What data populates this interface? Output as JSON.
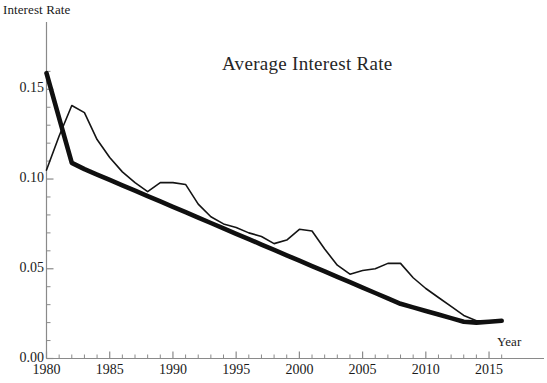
{
  "chart_data": {
    "type": "line",
    "title": "Average Interest Rate",
    "xlabel": "Year",
    "ylabel": "Interest Rate",
    "xlim": [
      1980,
      2016.5
    ],
    "ylim": [
      0.0,
      0.168
    ],
    "grid": false,
    "legend": "none",
    "xticks": [
      1980,
      1985,
      1990,
      1995,
      2000,
      2005,
      2010,
      2015
    ],
    "xtick_labels": [
      "1980",
      "1985",
      "1990",
      "1995",
      "2000",
      "2005",
      "2010",
      "2015"
    ],
    "xminor_step": 1,
    "yticks": [
      0.0,
      0.05,
      0.1,
      0.15
    ],
    "ytick_labels": [
      "0.00",
      "0.05",
      "0.10",
      "0.15"
    ],
    "yminor_step": 0.01,
    "x": [
      1980,
      1981,
      1982,
      1983,
      1984,
      1985,
      1986,
      1987,
      1988,
      1989,
      1990,
      1991,
      1992,
      1993,
      1994,
      1995,
      1996,
      1997,
      1998,
      1999,
      2000,
      2001,
      2002,
      2003,
      2004,
      2005,
      2006,
      2007,
      2008,
      2009,
      2010,
      2011,
      2012,
      2013,
      2014,
      2015,
      2016
    ],
    "series": [
      {
        "name": "Interest Rate",
        "style": "thin",
        "color": "#141414",
        "width": 1.6,
        "values": [
          0.105,
          0.124,
          0.141,
          0.137,
          0.122,
          0.112,
          0.104,
          0.098,
          0.093,
          0.098,
          0.098,
          0.097,
          0.086,
          0.079,
          0.075,
          0.073,
          0.07,
          0.068,
          0.064,
          0.066,
          0.072,
          0.071,
          0.061,
          0.052,
          0.047,
          0.049,
          0.05,
          0.053,
          0.053,
          0.045,
          0.039,
          0.034,
          0.029,
          0.024,
          0.021,
          0.021,
          0.021
        ]
      },
      {
        "name": "Trend",
        "style": "thick",
        "color": "#101010",
        "width": 4.6,
        "values": [
          0.159,
          0.134,
          0.109,
          0.1055,
          0.1025,
          0.0995,
          0.0965,
          0.0935,
          0.0905,
          0.0875,
          0.0845,
          0.0815,
          0.0785,
          0.0755,
          0.0725,
          0.0695,
          0.0665,
          0.0635,
          0.0605,
          0.0575,
          0.0545,
          0.0515,
          0.0485,
          0.0455,
          0.0425,
          0.0395,
          0.0365,
          0.0335,
          0.0305,
          0.0285,
          0.0265,
          0.0245,
          0.0225,
          0.0205,
          0.02,
          0.0205,
          0.021
        ]
      }
    ]
  },
  "axes": {
    "ylabel": "Interest Rate",
    "xlabel": "Year"
  },
  "title": "Average Interest Rate"
}
